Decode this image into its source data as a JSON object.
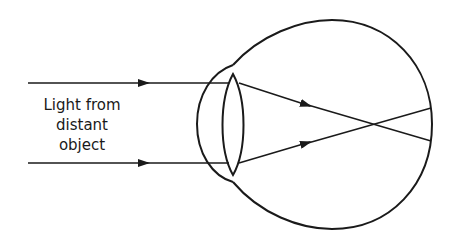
{
  "diagram": {
    "label_lines": [
      "Light from",
      "distant",
      "object"
    ],
    "stroke_color": "#1a1a1a",
    "background": "#ffffff",
    "parts": [
      "incoming-ray-top",
      "incoming-ray-bottom",
      "cornea",
      "lens",
      "eyeball",
      "refracted-ray-top",
      "refracted-ray-bottom",
      "focal-crossing-point",
      "retina"
    ]
  }
}
